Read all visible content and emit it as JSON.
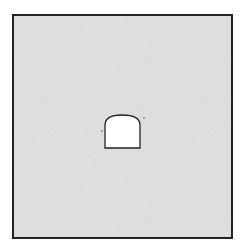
{
  "diagram": {
    "type": "tunnel-cross-section",
    "rock_mass": {
      "fill": "#d4d4d4",
      "border": "#222222",
      "x": 13,
      "y": 15,
      "width": 219,
      "height": 223
    },
    "tunnel": {
      "shape": "horseshoe-arch",
      "fill": "#ffffff",
      "stroke": "#222222",
      "left": 105,
      "right": 140,
      "bottom": 148,
      "spring": 125,
      "crown": 115
    }
  }
}
